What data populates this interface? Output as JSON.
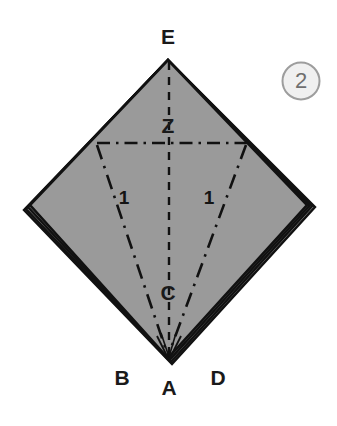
{
  "figure": {
    "step_badge": {
      "label": "2",
      "circle_fill": "#f0f0f0",
      "circle_stroke": "#9d9d9d",
      "text_color": "#6f6f6f"
    },
    "colors": {
      "paper_fill": "#9a9a9a",
      "paper_fill_shadow": "#8d8d8d",
      "edge_stroke": "#111111",
      "crease_stroke": "#111111",
      "background": "#ffffff",
      "label_color": "#1a1a1a"
    },
    "vertex_labels": [
      {
        "name": "E",
        "text": "E",
        "x": 168,
        "y": 38
      },
      {
        "name": "Z",
        "text": "Z",
        "x": 168,
        "y": 127
      },
      {
        "name": "C",
        "text": "C",
        "x": 168,
        "y": 294
      },
      {
        "name": "B",
        "text": "B",
        "x": 122,
        "y": 379
      },
      {
        "name": "A",
        "text": "A",
        "x": 169,
        "y": 389
      },
      {
        "name": "D",
        "text": "D",
        "x": 218,
        "y": 379
      }
    ],
    "crease_labels": [
      {
        "name": "left-one",
        "text": "1",
        "x": 124,
        "y": 199
      },
      {
        "name": "right-one",
        "text": "1",
        "x": 209,
        "y": 199
      }
    ],
    "geometry": {
      "apex_e": {
        "x": 168,
        "y": 60
      },
      "vertex_left": {
        "x": 30,
        "y": 205
      },
      "vertex_right": {
        "x": 307,
        "y": 205
      },
      "vertex_a": {
        "x": 168,
        "y": 358
      },
      "point_z": {
        "x": 169,
        "y": 142
      },
      "point_c": {
        "x": 169,
        "y": 300
      },
      "horizontal_crease": {
        "x1": 97,
        "y1": 143,
        "x2": 247,
        "y2": 143
      },
      "left_diagonal_crease": {
        "x1": 97,
        "y1": 145,
        "x2": 168,
        "y2": 356
      },
      "right_diagonal_crease": {
        "x1": 246,
        "y1": 145,
        "x2": 168,
        "y2": 356
      },
      "vertical_crease": {
        "x1": 169,
        "y1": 62,
        "x2": 169,
        "y2": 356
      }
    }
  }
}
